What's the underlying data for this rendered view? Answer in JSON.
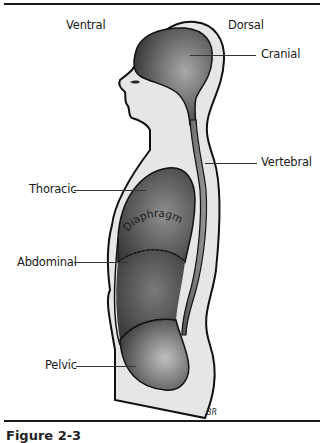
{
  "figure": {
    "orientation": {
      "left": "Ventral",
      "right": "Dorsal"
    },
    "labels": {
      "cranial": "Cranial",
      "vertebral": "Vertebral",
      "thoracic": "Thoracic",
      "diaphragm": "Diaphragm",
      "abdominal": "Abdominal",
      "pelvic": "Pelvic"
    },
    "signature": "BR",
    "caption": "Figure 2-3"
  },
  "colors": {
    "skin": "#e4e4e4",
    "cavity_dark": "#3a3a3a",
    "cavity_light": "#9a9a9a",
    "outline": "#111111",
    "rule": "#1a1a1a"
  }
}
